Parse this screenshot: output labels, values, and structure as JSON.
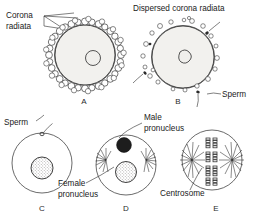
{
  "figure": {
    "type": "biology-diagram",
    "panel_count": 5
  },
  "labels": {
    "corona_radiata": "Corona\nradiata",
    "corona_radiata_line1": "Corona",
    "corona_radiata_line2": "radiata",
    "dispersed_corona_radiata": "Dispersed corona radiata",
    "sperm_b": "Sperm",
    "sperm_c": "Sperm",
    "male_pronucleus_line1": "Male",
    "male_pronucleus_line2": "pronucleus",
    "female_pronucleus_line1": "Female",
    "female_pronucleus_line2": "pronucleus",
    "centrosome": "Centrosome"
  },
  "panels": [
    {
      "id": "A",
      "letter": "A",
      "caption": "Corona radiata",
      "description": "Ovum surrounded by an intact ring of corona radiata cells"
    },
    {
      "id": "B",
      "letter": "B",
      "caption": "Dispersed corona radiata",
      "description": "Corona radiata cells dispersing; sperm approaching the ovum"
    },
    {
      "id": "C",
      "letter": "C",
      "caption": "Sperm",
      "description": "Single sperm penetrating the ovum; female nucleus visible"
    },
    {
      "id": "D",
      "letter": "D",
      "caption": "Male pronucleus and female pronucleus",
      "description": "Male pronucleus (dark) and female pronucleus (stippled) with asters"
    },
    {
      "id": "E",
      "letter": "E",
      "caption": "Centrosome",
      "description": "Chromosomes aligned on spindle between two centrosomes"
    }
  ],
  "colors": {
    "ink": "#2b2b2b",
    "text": "#1a1a1a",
    "cytoplasm": "#f2f1ee",
    "male_pronucleus": "#1d1d1d",
    "background": "#ffffff"
  }
}
